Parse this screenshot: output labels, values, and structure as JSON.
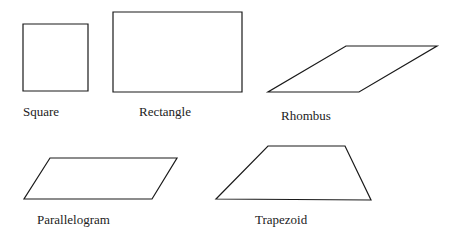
{
  "shapes": [
    {
      "name": "Square",
      "points": "23,24 88,24 88,91 23,91"
    },
    {
      "name": "Rectangle",
      "points": "113,12 242,12 242,92 113,92"
    },
    {
      "name": "Rhombus",
      "points": "346,46 437,46 359,92 268,92"
    },
    {
      "name": "Parallelogram",
      "points": "50,158 177,158 152,199 24,199"
    },
    {
      "name": "Trapezoid",
      "points": "268,146 345,146 371,200 216,199"
    }
  ],
  "labels": {
    "square": "Square",
    "rectangle": "Rectangle",
    "rhombus": "Rhombus",
    "parallelogram": "Parallelogram",
    "trapezoid": "Trapezoid"
  },
  "colors": {
    "stroke": "#1a1a1a",
    "background": "#ffffff"
  }
}
